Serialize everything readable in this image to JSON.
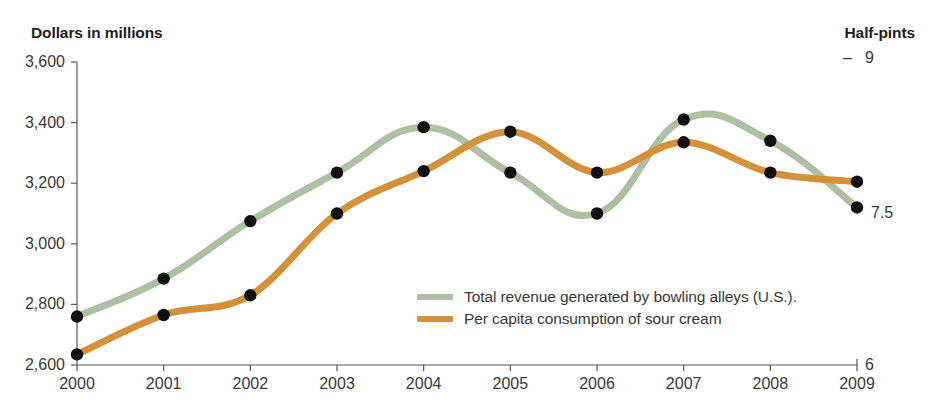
{
  "header": {
    "left_label": "Dollars in millions",
    "right_label": "Half-pints"
  },
  "legend": {
    "items": [
      {
        "label": "Total revenue generated by bowling alleys (U.S.).",
        "color": "#aec0a4",
        "key": "bowling"
      },
      {
        "label": "Per capita consumption of sour cream",
        "color": "#d4913c",
        "key": "sourcream"
      }
    ]
  },
  "axes": {
    "left": {
      "title": "Dollars in millions",
      "ticks": [
        "3,600",
        "3,400",
        "3,200",
        "3,000",
        "2,800",
        "2,600"
      ],
      "tick_values": [
        3600,
        3400,
        3200,
        3000,
        2800,
        2600
      ],
      "min": 2600,
      "max": 3600
    },
    "right": {
      "title": "Half-pints",
      "ticks": [
        "9",
        "7.5",
        "6"
      ],
      "tick_values": [
        9,
        7.5,
        6
      ],
      "min": 6,
      "max": 9
    },
    "x": {
      "ticks": [
        "2000",
        "2001",
        "2002",
        "2003",
        "2004",
        "2005",
        "2006",
        "2007",
        "2008",
        "2009"
      ]
    }
  },
  "chart_data": {
    "type": "line",
    "title": "",
    "subtitle": "",
    "xlabel": "",
    "ylabel": "Dollars in millions",
    "y2label": "Half-pints",
    "ylim": [
      2600,
      3600
    ],
    "y2lim": [
      6,
      9
    ],
    "grid": false,
    "legend_position": "inside-center-right",
    "markers": "filled-black-circles",
    "x": [
      2000,
      2001,
      2002,
      2003,
      2004,
      2005,
      2006,
      2007,
      2008,
      2009
    ],
    "categories": [
      "2000",
      "2001",
      "2002",
      "2003",
      "2004",
      "2005",
      "2006",
      "2007",
      "2008",
      "2009"
    ],
    "series": [
      {
        "name": "Total revenue generated by bowling alleys (U.S.).",
        "key": "bowling",
        "axis": "left",
        "units": "Dollars in millions",
        "color": "#aec0a4",
        "values": [
          2760,
          2885,
          3075,
          3235,
          3385,
          3235,
          3100,
          3410,
          3340,
          3120
        ]
      },
      {
        "name": "Per capita consumption of sour cream",
        "key": "sourcream",
        "axis": "right",
        "units": "Half-pints",
        "color": "#d4913c",
        "values_left_scale": [
          2635,
          2765,
          2830,
          3100,
          3240,
          3370,
          3235,
          3335,
          3235,
          3205
        ],
        "values": [
          6.11,
          6.5,
          6.69,
          7.5,
          7.92,
          8.31,
          7.91,
          8.21,
          7.91,
          7.82
        ]
      }
    ],
    "annotations": [
      {
        "text": "7.5",
        "near": "right-axis",
        "x": 2009
      },
      {
        "text": "9",
        "near": "right-axis-top"
      },
      {
        "text": "6",
        "near": "right-axis-bottom"
      }
    ]
  }
}
